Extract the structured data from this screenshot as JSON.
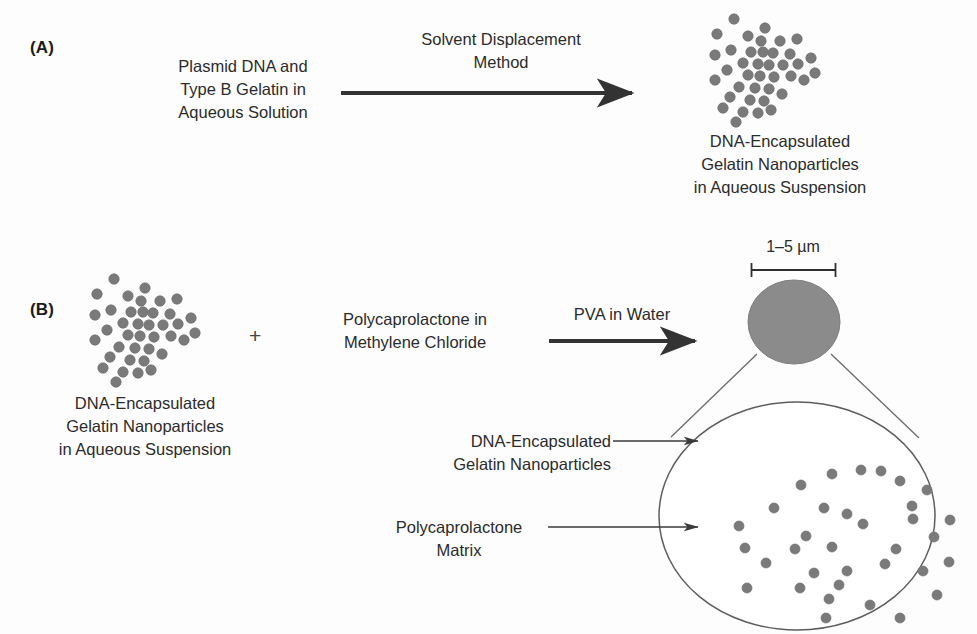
{
  "figure": {
    "background_color": "#fdfdfd",
    "particle_color": "#7a7a7a",
    "microsphere_color": "#8b8b8b",
    "line_color": "#3a3a3a",
    "text_color": "#2b2b2b"
  },
  "panel_a": {
    "label": "(A)",
    "reactant_text": "Plasmid DNA and\nType B Gelatin in\nAqueous Solution",
    "arrow_label": "Solvent Displacement\nMethod",
    "product_text": "DNA-Encapsulated\nGelatin Nanoparticles\nin Aqueous Suspension"
  },
  "panel_b": {
    "label": "(B)",
    "reactant_text": "DNA-Encapsulated\nGelatin Nanoparticles\nin Aqueous Suspension",
    "plus": "+",
    "second_reactant_text": "Polycaprolactone in\nMethylene Chloride",
    "arrow_label": "PVA in Water",
    "scale_label": "1–5 µm",
    "callout_nanoparticles": "DNA-Encapsulated\nGelatin Nanoparticles",
    "callout_matrix": "Polycaprolactone\nMatrix"
  },
  "clusters": {
    "nanoparticle_radius": 5.2,
    "cluster_points": [
      [
        31,
        11
      ],
      [
        45,
        28
      ],
      [
        14,
        26
      ],
      [
        62,
        20
      ],
      [
        77,
        33
      ],
      [
        58,
        33
      ],
      [
        28,
        42
      ],
      [
        48,
        44
      ],
      [
        60,
        44
      ],
      [
        70,
        45
      ],
      [
        94,
        31
      ],
      [
        87,
        46
      ],
      [
        12,
        47
      ],
      [
        40,
        55
      ],
      [
        55,
        56
      ],
      [
        66,
        57
      ],
      [
        80,
        57
      ],
      [
        95,
        56
      ],
      [
        108,
        50
      ],
      [
        24,
        62
      ],
      [
        45,
        67
      ],
      [
        57,
        68
      ],
      [
        71,
        69
      ],
      [
        88,
        68
      ],
      [
        12,
        72
      ],
      [
        36,
        79
      ],
      [
        52,
        80
      ],
      [
        66,
        81
      ],
      [
        101,
        72
      ],
      [
        112,
        65
      ],
      [
        27,
        89
      ],
      [
        47,
        92
      ],
      [
        61,
        93
      ],
      [
        79,
        86
      ],
      [
        20,
        100
      ],
      [
        40,
        104
      ],
      [
        55,
        105
      ],
      [
        33,
        114
      ],
      [
        68,
        102
      ]
    ]
  },
  "microsphere_interior": {
    "particle_radius": 5.0,
    "points": [
      [
        104,
        45
      ],
      [
        135,
        34
      ],
      [
        164,
        30
      ],
      [
        184,
        31
      ],
      [
        203,
        41
      ],
      [
        230,
        50
      ],
      [
        77,
        68
      ],
      [
        127,
        68
      ],
      [
        150,
        74
      ],
      [
        215,
        66
      ],
      [
        216,
        79
      ],
      [
        253,
        80
      ],
      [
        42,
        86
      ],
      [
        109,
        96
      ],
      [
        166,
        84
      ],
      [
        237,
        97
      ],
      [
        98,
        109
      ],
      [
        135,
        107
      ],
      [
        199,
        109
      ],
      [
        48,
        108
      ],
      [
        69,
        123
      ],
      [
        188,
        124
      ],
      [
        252,
        122
      ],
      [
        117,
        133
      ],
      [
        150,
        131
      ],
      [
        142,
        145
      ],
      [
        226,
        131
      ],
      [
        50,
        148
      ],
      [
        103,
        148
      ],
      [
        132,
        159
      ],
      [
        173,
        165
      ],
      [
        240,
        155
      ],
      [
        203,
        178
      ],
      [
        129,
        178
      ]
    ]
  }
}
